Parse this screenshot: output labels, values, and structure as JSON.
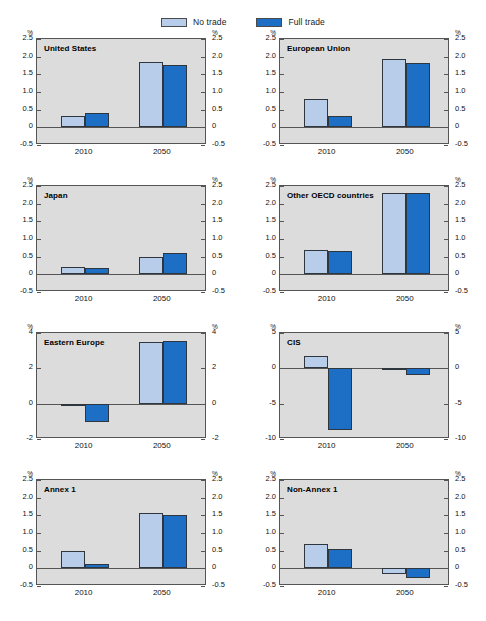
{
  "legend": {
    "entries": [
      {
        "label": "No trade",
        "color": "#b7cdea"
      },
      {
        "label": "Full trade",
        "color": "#1c6fc4"
      }
    ]
  },
  "axis_unit": "%",
  "chart_data": {
    "type": "bar",
    "title": "",
    "xlabel": "",
    "ylabel": "%",
    "grid": false,
    "legend_position": "top-center",
    "categories": [
      "2010",
      "2050"
    ],
    "series_names": [
      "No trade",
      "Full trade"
    ],
    "series_colors": [
      "#b7cdea",
      "#1c6fc4"
    ],
    "panels": [
      {
        "name": "United States",
        "ylim": [
          -0.5,
          2.5
        ],
        "yticks": [
          2.5,
          2.0,
          1.5,
          1.0,
          0.5,
          0,
          -0.5
        ],
        "ytick_labels": [
          "2.5",
          "2.0",
          "1.5",
          "1.0",
          "0.5",
          "0",
          "-0.5"
        ],
        "series": [
          {
            "name": "No trade",
            "values": [
              0.33,
              1.85
            ]
          },
          {
            "name": "Full trade",
            "values": [
              0.4,
              1.77
            ]
          }
        ]
      },
      {
        "name": "European Union",
        "ylim": [
          -0.5,
          2.5
        ],
        "yticks": [
          2.5,
          2.0,
          1.5,
          1.0,
          0.5,
          0,
          -0.5
        ],
        "ytick_labels": [
          "2.5",
          "2.0",
          "1.5",
          "1.0",
          "0.5",
          "0",
          "-0.5"
        ],
        "series": [
          {
            "name": "No trade",
            "values": [
              0.8,
              1.93
            ]
          },
          {
            "name": "Full trade",
            "values": [
              0.33,
              1.82
            ]
          }
        ]
      },
      {
        "name": "Japan",
        "ylim": [
          -0.5,
          2.5
        ],
        "yticks": [
          2.5,
          2.0,
          1.5,
          1.0,
          0.5,
          0,
          -0.5
        ],
        "ytick_labels": [
          "2.5",
          "2.0",
          "1.5",
          "1.0",
          "0.5",
          "0",
          "-0.5"
        ],
        "series": [
          {
            "name": "No trade",
            "values": [
              0.22,
              0.5
            ]
          },
          {
            "name": "Full trade",
            "values": [
              0.17,
              0.6
            ]
          }
        ]
      },
      {
        "name": "Other OECD countries",
        "ylim": [
          -0.5,
          2.5
        ],
        "yticks": [
          2.5,
          2.0,
          1.5,
          1.0,
          0.5,
          0,
          -0.5
        ],
        "ytick_labels": [
          "2.5",
          "2.0",
          "1.5",
          "1.0",
          "0.5",
          "0",
          "-0.5"
        ],
        "series": [
          {
            "name": "No trade",
            "values": [
              0.68,
              2.3
            ]
          },
          {
            "name": "Full trade",
            "values": [
              0.65,
              2.29
            ]
          }
        ]
      },
      {
        "name": "Eastern Europe",
        "ylim": [
          -2,
          4
        ],
        "yticks": [
          4,
          2,
          0,
          -2
        ],
        "ytick_labels": [
          "4",
          "2",
          "0",
          "-2"
        ],
        "series": [
          {
            "name": "No trade",
            "values": [
              -0.12,
              3.5
            ]
          },
          {
            "name": "Full trade",
            "values": [
              -1.03,
              3.52
            ]
          }
        ]
      },
      {
        "name": "CIS",
        "ylim": [
          -10,
          5
        ],
        "yticks": [
          5,
          0,
          -5,
          -10
        ],
        "ytick_labels": [
          "5",
          "0",
          "-5",
          "-10"
        ],
        "series": [
          {
            "name": "No trade",
            "values": [
              1.7,
              -0.12
            ]
          },
          {
            "name": "Full trade",
            "values": [
              -8.7,
              -0.9
            ]
          }
        ]
      },
      {
        "name": "Annex 1",
        "ylim": [
          -0.5,
          2.5
        ],
        "yticks": [
          2.5,
          2.0,
          1.5,
          1.0,
          0.5,
          0,
          -0.5
        ],
        "ytick_labels": [
          "2.5",
          "2.0",
          "1.5",
          "1.0",
          "0.5",
          "0",
          "-0.5"
        ],
        "series": [
          {
            "name": "No trade",
            "values": [
              0.49,
              1.58
            ]
          },
          {
            "name": "Full trade",
            "values": [
              0.12,
              1.5
            ]
          }
        ]
      },
      {
        "name": "Non-Annex 1",
        "ylim": [
          -0.5,
          2.5
        ],
        "yticks": [
          2.5,
          2.0,
          1.5,
          1.0,
          0.5,
          0,
          -0.5
        ],
        "ytick_labels": [
          "2.5",
          "2.0",
          "1.5",
          "1.0",
          "0.5",
          "0",
          "-0.5"
        ],
        "series": [
          {
            "name": "No trade",
            "values": [
              0.68,
              -0.15
            ]
          },
          {
            "name": "Full trade",
            "values": [
              0.55,
              -0.28
            ]
          }
        ]
      }
    ]
  }
}
